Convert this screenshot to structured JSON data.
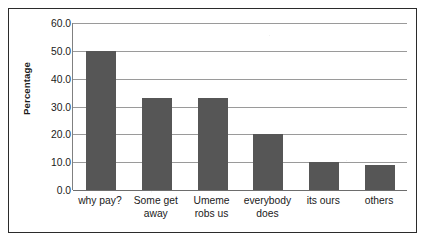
{
  "chart_data": {
    "type": "bar",
    "title": "",
    "subtitle": "",
    "xlabel": "",
    "ylabel": "Percentage",
    "categories": [
      "why pay?",
      "Some get away",
      "Umeme robs us",
      "everybody does",
      "its ours",
      "others"
    ],
    "values": [
      50.0,
      33.0,
      33.0,
      20.0,
      10.0,
      9.0
    ],
    "series": [
      {
        "name": "Percentage",
        "values": [
          50.0,
          33.0,
          33.0,
          20.0,
          10.0,
          9.0
        ]
      }
    ],
    "ylim": [
      0.0,
      60.0
    ],
    "ytick_step": 10.0,
    "ytick_labels": [
      "0.0",
      "10.0",
      "20.0",
      "30.0",
      "40.0",
      "50.0",
      "60.0"
    ],
    "ytick_values": [
      0.0,
      10.0,
      20.0,
      30.0,
      40.0,
      50.0,
      60.0
    ],
    "grid": "horizontal",
    "legend": "none",
    "annotations": []
  },
  "style": {
    "bar_color": "#565656",
    "gridline_color": "#9a9a9a",
    "axis_color": "#6d6d6d",
    "border_color": "#2b2b2b",
    "text_color": "#1a1a1a",
    "background": "#ffffff"
  },
  "axes": {
    "y_title": "Percentage"
  }
}
